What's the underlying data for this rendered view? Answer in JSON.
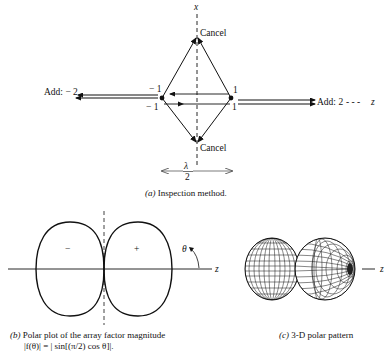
{
  "panel_a": {
    "axis_x_label": "x",
    "axis_z_label": "z",
    "top_label": "Cancel",
    "bottom_label": "Cancel",
    "left_label": "Add: − 2",
    "right_label": "Add: 2",
    "right_dashes": "- - -",
    "left_upper": "− 1",
    "left_lower": "− 1",
    "right_upper": "1",
    "right_lower": "1",
    "spacing_num": "λ",
    "spacing_den": "2",
    "caption_prefix": "(a)",
    "caption_text": " Inspection method."
  },
  "panel_b": {
    "minus_sign": "−",
    "plus_sign": "+",
    "theta": "θ",
    "axis_label": "z",
    "caption_line1_prefix": "(b)",
    "caption_line1": " Polar plot of the array factor magnitude",
    "caption_line2": "|f(θ)| = | sin[(π/2) cos θ]|."
  },
  "panel_c": {
    "axis_label": "z",
    "caption_prefix": "(c)",
    "caption_text": " 3-D polar pattern"
  }
}
